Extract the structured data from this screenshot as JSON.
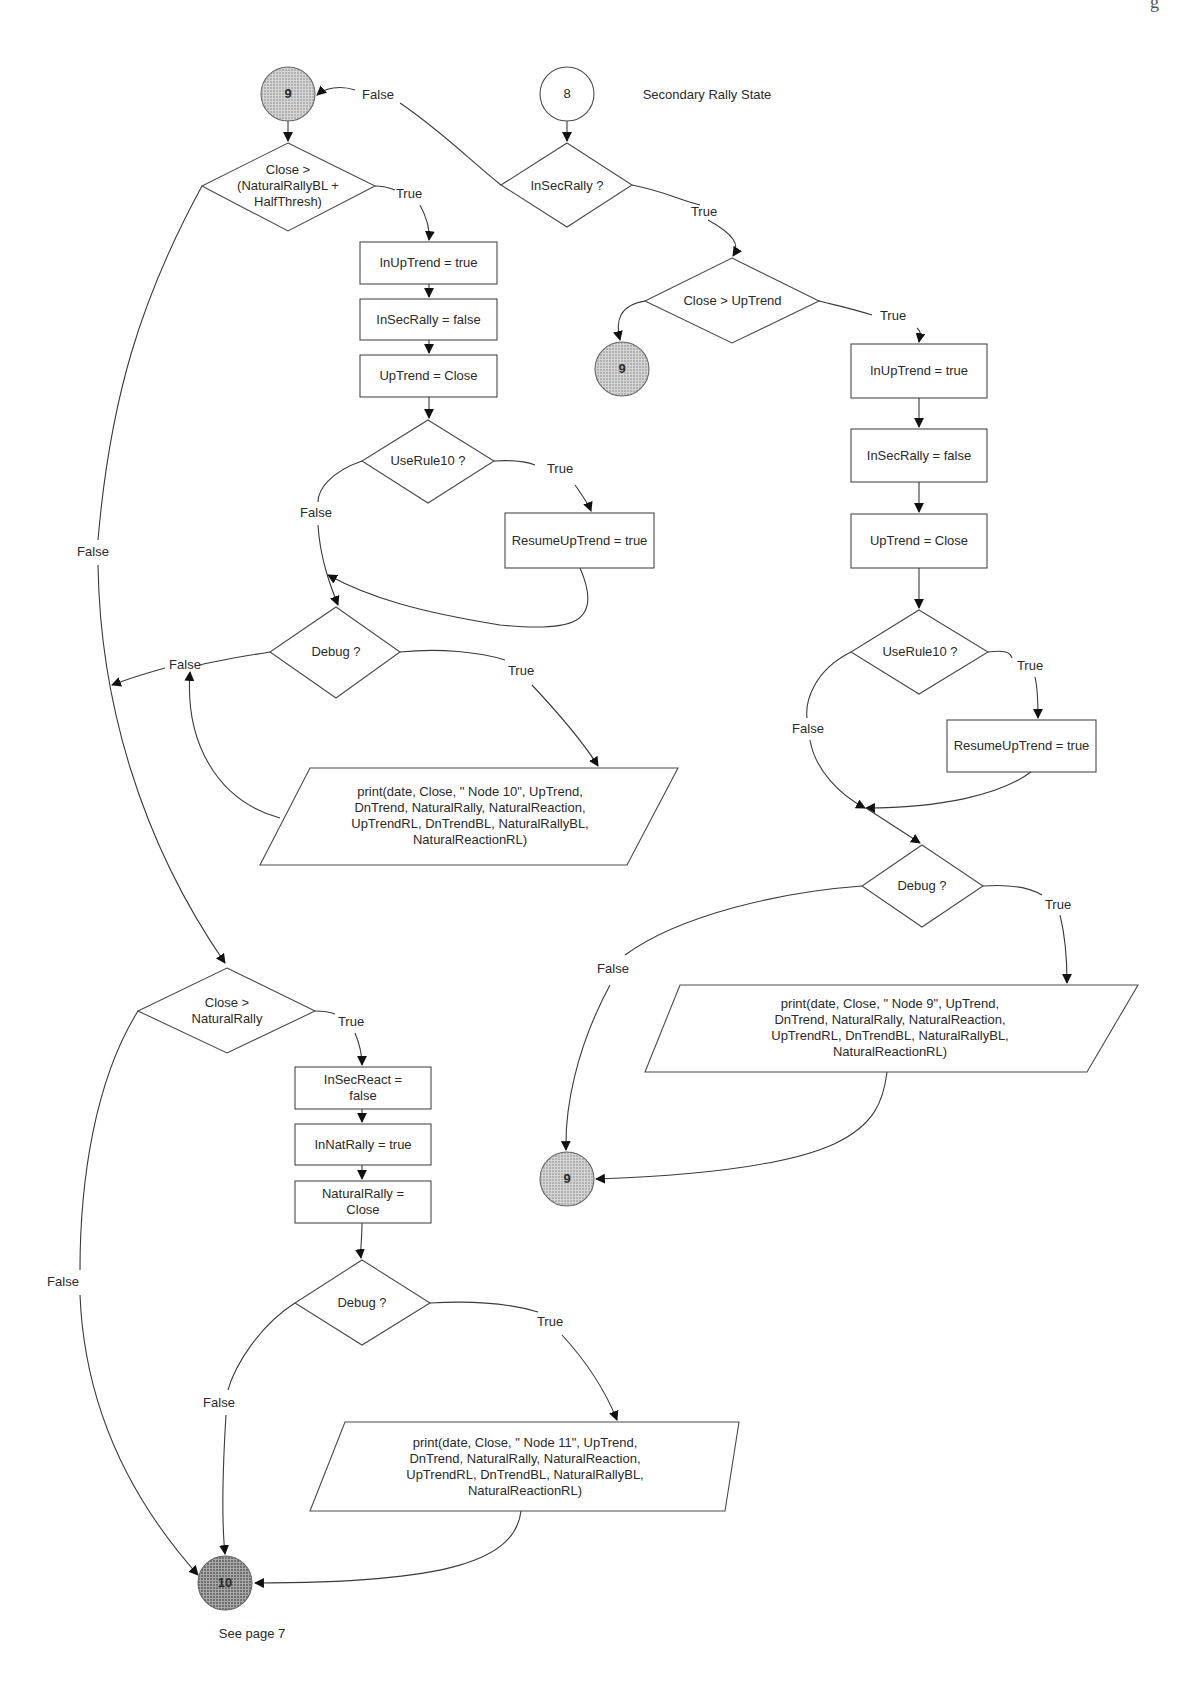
{
  "page": {
    "corner_mark": "g"
  },
  "title": {
    "node_id": "8",
    "label": "Secondary Rally State"
  },
  "nodes": {
    "start_8": "8",
    "conn_9_top": "9",
    "conn_9_mid": "9",
    "conn_9_bottom": "9",
    "conn_10": "10",
    "d_close_halfthresh": "Close >\n(NaturalRallyBL +\nHalfThresh)",
    "d_insecrally": "InSecRally ?",
    "d_close_uptrend": "Close > UpTrend",
    "l_inuptrend": "InUpTrend = true",
    "l_insecrally": "InSecRally = false",
    "l_uptrend": "UpTrend = Close",
    "l_userule10": "UseRule10 ?",
    "l_resume": "ResumeUpTrend = true",
    "l_debug": "Debug ?",
    "l_print": "print(date, Close, \" Node 10\", UpTrend,\nDnTrend, NaturalRally, NaturalReaction,\nUpTrendRL, DnTrendBL, NaturalRallyBL,\nNaturalReactionRL)",
    "r_inuptrend": "InUpTrend = true",
    "r_insecrally": "InSecRally = false",
    "r_uptrend": "UpTrend = Close",
    "r_userule10": "UseRule10 ?",
    "r_resume": "ResumeUpTrend = true",
    "r_debug": "Debug ?",
    "r_print": "print(date, Close, \" Node 9\", UpTrend,\nDnTrend, NaturalRally, NaturalReaction,\nUpTrendRL, DnTrendBL, NaturalRallyBL,\nNaturalReactionRL)",
    "b_close_natrally": "Close >\nNaturalRally",
    "b_insecreact": "InSecReact =\nfalse",
    "b_innatrally": "InNatRally = true",
    "b_naturalrally": "NaturalRally =\nClose",
    "b_debug": "Debug ?",
    "b_print": "print(date, Close, \" Node 11\", UpTrend,\nDnTrend, NaturalRally, NaturalReaction,\nUpTrendRL, DnTrendBL, NaturalRallyBL,\nNaturalReactionRL)"
  },
  "edge_labels": {
    "insecrally_false": "False",
    "insecrally_true": "True",
    "close_uptrend_true": "True",
    "halfthresh_true": "True",
    "halfthresh_false": "False",
    "l_userule10_true": "True",
    "l_userule10_false": "False",
    "l_debug_false": "False",
    "l_debug_true": "True",
    "r_userule10_true": "True",
    "r_userule10_false": "False",
    "r_debug_true": "True",
    "r_debug_false": "False",
    "natrally_true": "True",
    "natrally_false": "False",
    "b_debug_true": "True",
    "b_debug_false": "False"
  },
  "footer": {
    "see_page": "See page 7"
  },
  "colors": {
    "stroke": "#4a4a4a",
    "connector_fill": "#b5b5b5",
    "connector_dark_fill": "#8a8a8a"
  }
}
